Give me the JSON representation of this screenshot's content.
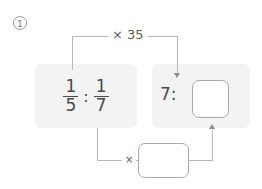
{
  "exercise": {
    "number": "1"
  },
  "problem": {
    "type": "ratio-scaling",
    "left_term": {
      "first_fraction": {
        "numerator": "1",
        "denominator": "5"
      },
      "ratio_symbol": ":",
      "second_fraction": {
        "numerator": "1",
        "denominator": "7"
      }
    },
    "right_term": {
      "known_value": "7",
      "ratio_symbol": ":",
      "unknown_value": ""
    },
    "operations": {
      "top_label": "× 35",
      "bottom_label": "×",
      "bottom_factor_value": ""
    }
  },
  "icons": {
    "arrow_down": "arrow-down-icon",
    "arrow_up": "arrow-up-icon"
  },
  "colors": {
    "panel_background": "#f3f3f3",
    "text": "#4a4a4a",
    "connector": "#b9b9b9",
    "box_border": "#a8a8a8",
    "arrowhead": "#8e8e8e"
  }
}
